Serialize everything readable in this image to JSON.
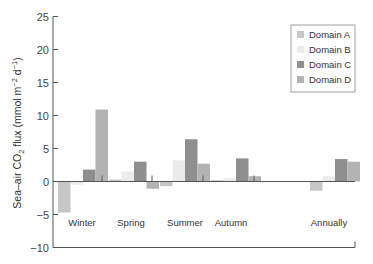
{
  "chart_data": {
    "type": "bar",
    "title": "",
    "xlabel": "",
    "ylabel": "Sea–air CO2 flux (mmol m−2 d−1)",
    "ylabel_parts": {
      "pre": "Sea–air CO",
      "sub": "2",
      "mid": " flux (mmol m",
      "sup1": "−2",
      "mid2": " d",
      "sup2": "−1",
      "post": ")"
    },
    "ylim": [
      -10,
      25
    ],
    "yticks": [
      -10,
      -5,
      0,
      5,
      10,
      15,
      20,
      25
    ],
    "ytick_labels": [
      "−10",
      "−5",
      "0",
      "5",
      "10",
      "15",
      "20",
      "25"
    ],
    "categories": [
      "Winter",
      "Spring",
      "Summer",
      "Autumn",
      "Annually"
    ],
    "series": [
      {
        "name": "Domain A",
        "color": "#c6c6c6",
        "values": [
          -4.7,
          0.3,
          -0.7,
          0.2,
          -1.4
        ]
      },
      {
        "name": "Domain B",
        "color": "#ebebeb",
        "values": [
          -0.5,
          1.5,
          3.2,
          0.5,
          0.8
        ]
      },
      {
        "name": "Domain C",
        "color": "#8f8f8f",
        "values": [
          1.8,
          3.0,
          6.4,
          3.5,
          3.4
        ]
      },
      {
        "name": "Domain D",
        "color": "#b3b3b3",
        "values": [
          10.9,
          -1.1,
          2.7,
          0.8,
          3.0
        ]
      }
    ],
    "grid": false,
    "legend_position": "upper right"
  }
}
